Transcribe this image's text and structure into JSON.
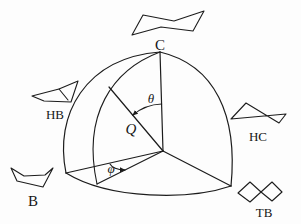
{
  "figure": {
    "background_color": "#fdfdfd",
    "line_color": "#1c1c1c",
    "labels": {
      "chair": "C",
      "half_boat": "HB",
      "boat": "B",
      "half_chair": "HC",
      "twist_boat": "TB"
    },
    "symbols": {
      "puckering_amplitude": "Q",
      "polar_angle": "θ",
      "azimuthal_angle": "φ"
    }
  }
}
